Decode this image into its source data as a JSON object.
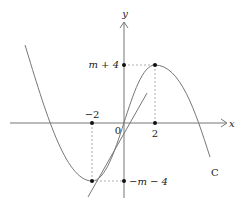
{
  "diagram": {
    "type": "function-graph",
    "axes": {
      "x_label": "x",
      "y_label": "y",
      "origin_label": "0"
    },
    "curve": {
      "name": "C",
      "kind": "cubic",
      "local_min": {
        "x": -2,
        "y_label": "−m − 4"
      },
      "local_max": {
        "x": 2,
        "y_label": "m + 4"
      }
    },
    "tick_labels": {
      "x_neg": "−2",
      "x_pos": "2",
      "y_top": "m + 4",
      "y_bottom": "−m − 4"
    },
    "extra_line": {
      "kind": "straight-line",
      "description": "line through the local minimum"
    },
    "colors": {
      "curve": "#777777",
      "axes": "#777777",
      "points": "#111111",
      "guides": "#999999"
    }
  }
}
